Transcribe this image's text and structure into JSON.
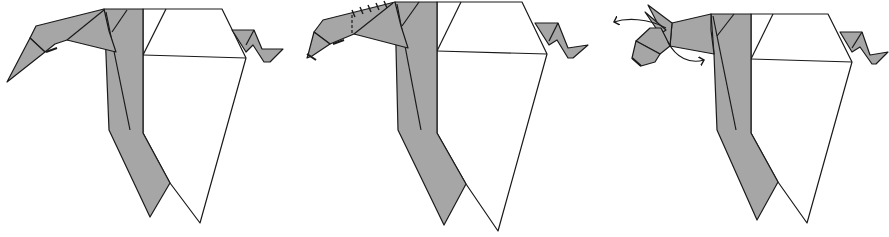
{
  "diagram": {
    "type": "origami-instructions",
    "steps": [
      {
        "index": 1,
        "description": "Figure with pointed head extended forward-down",
        "markers": []
      },
      {
        "index": 2,
        "description": "Head shaped; neck shows hidden-fold dashed line and tick marks along crease",
        "markers": [
          "dashed-line",
          "tick-marks"
        ]
      },
      {
        "index": 3,
        "description": "Ears formed; curved arrows indicate folding the ears back/out",
        "markers": [
          "curved-arrow-left",
          "curved-arrow-right"
        ]
      }
    ],
    "colors": {
      "paper_color_side": "#a6a6a6",
      "paper_white_side": "#ffffff",
      "outline": "#1a1a1a",
      "background": "#ffffff"
    }
  }
}
